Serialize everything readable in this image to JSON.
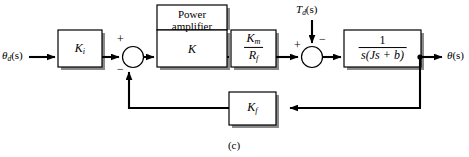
{
  "figure": {
    "caption": "(c)",
    "type": "control-system-block-diagram"
  },
  "signals": {
    "input_label": "θ",
    "input_sub": "d",
    "input_arg": "(s)",
    "output_label": "θ",
    "output_arg": "(s)",
    "disturbance_label": "T",
    "disturbance_sub": "d",
    "disturbance_arg": "(s)"
  },
  "blocks": {
    "controller": {
      "label": "K",
      "sub": "i",
      "name": "controller-gain"
    },
    "amplifier_caption": {
      "line1": "Power",
      "line2": "amplifier"
    },
    "amplifier": {
      "label": "K",
      "name": "power-amplifier-gain"
    },
    "motor": {
      "numerator": "K",
      "numerator_sub": "m",
      "denominator": "R",
      "denominator_sub": "f",
      "name": "motor-constant"
    },
    "plant": {
      "numerator": "1",
      "denominator": "s(Js + b)",
      "name": "plant-transfer-function"
    },
    "feedback": {
      "label": "K",
      "sub": "f",
      "name": "tachometer-feedback-gain"
    }
  },
  "junctions": {
    "first": {
      "plus_sign": "+",
      "minus_sign": "−"
    },
    "second": {
      "plus_sign": "+",
      "minus_sign": "−"
    }
  },
  "colors": {
    "line": "#000000",
    "box_fill": "#ffffff",
    "box_stroke": "#000000",
    "shadow": "#8a8a8a",
    "background": "#ffffff"
  }
}
